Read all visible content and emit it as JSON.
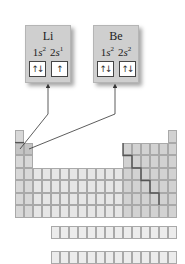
{
  "cards": [
    {
      "symbol": "Li",
      "config": [
        {
          "n": "1",
          "l": "s",
          "e": "2"
        },
        {
          "n": "2",
          "l": "s",
          "e": "1"
        }
      ],
      "orbitals": [
        "↑↓",
        "↑"
      ]
    },
    {
      "symbol": "Be",
      "config": [
        {
          "n": "1",
          "l": "s",
          "e": "2"
        },
        {
          "n": "2",
          "l": "s",
          "e": "2"
        }
      ],
      "orbitals": [
        "↑↓",
        "↑↓"
      ]
    }
  ],
  "colors": {
    "s_block": "#d8d8d8",
    "highlight": "#c4c4c4",
    "d_block": "#e6e6e6",
    "p_block": "#d2d2d2",
    "f_block": "#ececec",
    "staircase": "#555555"
  }
}
